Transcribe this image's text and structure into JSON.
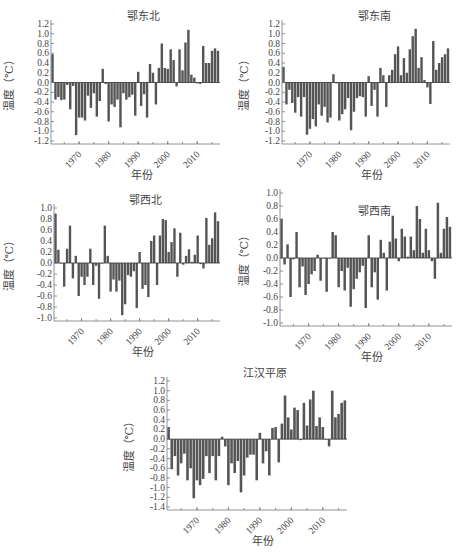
{
  "figure": {
    "ylabel": "温度（℃）",
    "xlabel": "年份",
    "bar_color": "#555555",
    "axis_color": "#777777"
  },
  "chart_data": [
    {
      "type": "bar",
      "title": "鄂东北",
      "xlabel": "年份",
      "ylabel": "温度（℃）",
      "x_start": 1961,
      "x_ticks": [
        1970,
        1980,
        1990,
        2000,
        2010
      ],
      "ylim": [
        -1.2,
        1.2
      ],
      "y_ticks": [
        1.2,
        1.0,
        0.8,
        0.6,
        0.4,
        0.2,
        0.0,
        -0.2,
        -0.4,
        -0.6,
        -0.8,
        -1.0,
        -1.2
      ],
      "grid": false,
      "values": [
        0.58,
        -0.35,
        -0.3,
        -0.36,
        -0.35,
        -0.05,
        -0.55,
        -0.07,
        -1.08,
        -0.72,
        -0.72,
        -0.78,
        -0.27,
        -0.52,
        -0.22,
        -0.7,
        -0.38,
        0.28,
        -0.03,
        -0.8,
        -0.45,
        -0.5,
        -0.35,
        -0.92,
        -0.22,
        -0.35,
        -0.3,
        -0.25,
        -0.68,
        0.22,
        -0.48,
        -0.24,
        -0.72,
        0.38,
        0.2,
        -0.45,
        0.3,
        0.8,
        0.3,
        0.28,
        0.68,
        0.46,
        -0.08,
        0.68,
        0.25,
        0.82,
        1.08,
        0.16,
        0.1,
        -0.02,
        -0.03,
        0.75,
        0.4,
        0.4,
        0.65,
        0.7,
        0.65
      ]
    },
    {
      "type": "bar",
      "title": "鄂东南",
      "xlabel": "年份",
      "ylabel": "温度（℃）",
      "x_start": 1961,
      "x_ticks": [
        1970,
        1980,
        1990,
        2000,
        2010
      ],
      "ylim": [
        -1.2,
        1.2
      ],
      "y_ticks": [
        1.2,
        1.0,
        0.8,
        0.6,
        0.4,
        0.2,
        0.0,
        -0.2,
        -0.4,
        -0.6,
        -0.8,
        -1.0,
        -1.2
      ],
      "grid": false,
      "values": [
        0.32,
        -0.45,
        -0.15,
        -0.42,
        -0.62,
        -0.3,
        -0.7,
        -0.3,
        -1.07,
        -0.95,
        -0.75,
        -0.9,
        -0.45,
        -0.68,
        -0.5,
        -0.82,
        -0.72,
        0.17,
        -0.02,
        -0.78,
        -0.65,
        -0.55,
        -0.32,
        -0.98,
        -0.6,
        -0.32,
        -0.28,
        -0.3,
        -0.7,
        0.13,
        -0.48,
        -0.15,
        -0.7,
        0.3,
        0.15,
        -0.5,
        0.15,
        0.26,
        0.58,
        0.74,
        0.15,
        0.5,
        0.2,
        0.68,
        0.95,
        1.1,
        0.3,
        0.52,
        0.05,
        -0.1,
        -0.44,
        0.85,
        0.26,
        0.4,
        0.52,
        0.58,
        0.7
      ]
    },
    {
      "type": "bar",
      "title": "鄂西北",
      "xlabel": "年份",
      "ylabel": "温度（℃）",
      "x_start": 1961,
      "x_ticks": [
        1970,
        1980,
        1990,
        2000,
        2010
      ],
      "ylim": [
        -1.0,
        1.0
      ],
      "y_ticks": [
        1.0,
        0.8,
        0.6,
        0.4,
        0.2,
        0.0,
        -0.2,
        -0.4,
        -0.6,
        -0.8,
        -1.0
      ],
      "grid": false,
      "values": [
        0.9,
        0.24,
        0.0,
        -0.43,
        0.26,
        0.68,
        -0.28,
        0.13,
        -0.6,
        -0.25,
        -0.4,
        -0.25,
        0.26,
        -0.4,
        -0.05,
        -0.65,
        0.0,
        0.68,
        0.13,
        -0.52,
        -0.3,
        -0.52,
        -0.32,
        -0.95,
        -0.75,
        -0.22,
        -0.25,
        -0.15,
        -0.82,
        0.2,
        -0.47,
        -0.4,
        -0.62,
        0.4,
        0.5,
        -0.4,
        0.5,
        0.8,
        0.78,
        0.2,
        0.38,
        0.63,
        -0.25,
        0.55,
        -0.03,
        0.13,
        0.25,
        0.02,
        0.15,
        0.5,
        -0.02,
        -0.1,
        0.82,
        0.33,
        0.45,
        0.92,
        0.76
      ]
    },
    {
      "type": "bar",
      "title": "鄂西南",
      "xlabel": "年份",
      "ylabel": "温度（℃）",
      "x_start": 1961,
      "x_ticks": [
        1970,
        1980,
        1990,
        2000,
        2010
      ],
      "ylim": [
        -1.0,
        1.0
      ],
      "y_ticks": [
        1.0,
        0.8,
        0.6,
        0.4,
        0.2,
        0.0,
        -0.2,
        -0.4,
        -0.6,
        -0.8,
        -1.0
      ],
      "grid": false,
      "values": [
        0.6,
        -0.1,
        0.21,
        -0.6,
        -0.02,
        0.4,
        -0.45,
        -0.13,
        -0.57,
        -0.4,
        -0.25,
        -0.2,
        0.05,
        -0.35,
        0.0,
        -0.52,
        0.0,
        0.4,
        0.35,
        -0.45,
        -0.2,
        -0.5,
        -0.15,
        -0.75,
        -0.48,
        -0.32,
        -0.22,
        -0.12,
        -0.77,
        0.35,
        -0.45,
        -0.22,
        -0.64,
        0.28,
        0.08,
        -0.5,
        0.25,
        0.65,
        0.3,
        -0.05,
        0.45,
        0.33,
        0.02,
        0.33,
        0.12,
        0.8,
        0.6,
        0.08,
        0.45,
        0.12,
        -0.05,
        -0.32,
        0.85,
        0.08,
        0.45,
        0.63,
        0.48
      ]
    },
    {
      "type": "bar",
      "title": "江汉平原",
      "xlabel": "年份",
      "ylabel": "温度（℃）",
      "x_start": 1961,
      "x_ticks": [
        1970,
        1980,
        1990,
        2000,
        2010
      ],
      "ylim": [
        -1.4,
        1.2
      ],
      "y_ticks": [
        1.2,
        1.0,
        0.8,
        0.6,
        0.4,
        0.2,
        0.0,
        -0.2,
        -0.4,
        -0.6,
        -0.8,
        -1.0,
        -1.2,
        -1.4
      ],
      "grid": false,
      "values": [
        0.25,
        -0.62,
        -0.35,
        -0.75,
        -0.5,
        -0.3,
        -0.85,
        -0.6,
        -1.22,
        -0.85,
        -0.95,
        -0.82,
        -0.35,
        -0.7,
        -0.35,
        -0.85,
        -0.35,
        0.05,
        -0.15,
        -0.95,
        -0.5,
        -0.7,
        -0.45,
        -1.1,
        -0.75,
        -0.38,
        -0.32,
        -0.32,
        -0.85,
        0.13,
        -0.5,
        -0.25,
        -0.75,
        0.23,
        0.25,
        -0.48,
        0.32,
        0.9,
        0.45,
        0.2,
        0.65,
        0.6,
        -0.02,
        0.75,
        0.28,
        0.82,
        1.0,
        0.27,
        0.45,
        0.25,
        0.0,
        -0.15,
        1.0,
        0.45,
        0.52,
        0.75,
        0.8
      ]
    }
  ]
}
